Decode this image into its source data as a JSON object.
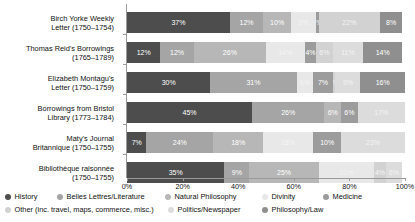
{
  "chart_data": {
    "type": "bar",
    "orientation": "horizontal",
    "stacked": true,
    "normalized": "100%",
    "title": "",
    "xlabel": "",
    "ylabel": "",
    "xlim": [
      0,
      100
    ],
    "grid": false,
    "legend_position": "bottom",
    "axis_ticks": [
      "0%",
      "20%",
      "40%",
      "60%",
      "80%",
      "100%"
    ],
    "axis_tick_values": [
      0,
      20,
      40,
      60,
      80,
      100
    ],
    "categories": [
      "Birch Yorke Weekly Letter (1750–1754)",
      "Thomas Reid's Borrowings (1765–1789)",
      "Elizabeth Montagu's Letter (1750–1759)",
      "Borrowings from Bristol Library (1773–1784)",
      "Maty's Journal Britannique (1750–1755)",
      "Bibliothèque raisonnée (1750–1755)"
    ],
    "category_lines": [
      [
        "Birch Yorke Weekly",
        "Letter (1750–1754)"
      ],
      [
        "Thomas Reid's Borrowings",
        "(1765–1789)"
      ],
      [
        "Elizabeth Montagu's",
        "Letter (1750–1759)"
      ],
      [
        "Borrowings from Bristol",
        "Library (1773–1784)"
      ],
      [
        "Maty's Journal",
        "Britannique (1750–1755)"
      ],
      [
        "Bibliothèque raisonnée",
        "(1750–1755)"
      ]
    ],
    "series": [
      {
        "name": "History",
        "color": "#4d4d4d",
        "values": [
          37,
          12,
          30,
          45,
          7,
          35
        ]
      },
      {
        "name": "Belles Lettres/Literature",
        "color": "#a5a5a5",
        "values": [
          12,
          12,
          31,
          26,
          24,
          9
        ]
      },
      {
        "name": "Natural Philosophy",
        "color": "#b7b7b7",
        "values": [
          10,
          26,
          0,
          6,
          18,
          25
        ]
      },
      {
        "name": "Divinity",
        "color": "#e8e8e8",
        "values": [
          9,
          14,
          6,
          0,
          18,
          20
        ]
      },
      {
        "name": "Medicine",
        "color": "#9c9c9c",
        "values": [
          1,
          4,
          7,
          6,
          10,
          0
        ]
      },
      {
        "name": "Other (inc. travel, maps, commerce, misc.)",
        "color": "#d2d2d2",
        "values": [
          22,
          6,
          1,
          0,
          0,
          4
        ]
      },
      {
        "name": "Politics/Newspaper",
        "color": "#dcdcdc",
        "values": [
          0,
          11,
          9,
          17,
          23,
          6
        ]
      },
      {
        "name": "Philosophy/Law",
        "color": "#8f8f8f",
        "values": [
          8,
          14,
          16,
          0,
          0,
          0
        ]
      }
    ],
    "bar_labels": [
      [
        "37%",
        "12%",
        "10%",
        "9%",
        "1%",
        "22%",
        "",
        "8%"
      ],
      [
        "12%",
        "12%",
        "26%",
        "14%",
        "4%",
        "6%",
        "11%",
        "14%"
      ],
      [
        "30%",
        "31%",
        "",
        "6%",
        "7%",
        "1%",
        "9%",
        "16%"
      ],
      [
        "45%",
        "26%",
        "6%",
        "",
        "6%",
        "",
        "17%",
        ""
      ],
      [
        "7%",
        "24%",
        "18%",
        "18%",
        "10%",
        "0",
        "23%",
        ""
      ],
      [
        "35%",
        "9%",
        "25%",
        "20%",
        "0",
        "4%",
        "6%",
        ""
      ]
    ]
  },
  "legend": {
    "items": [
      {
        "label": "History",
        "color": "#4d4d4d"
      },
      {
        "label": "Belles Lettres/Literature",
        "color": "#a5a5a5"
      },
      {
        "label": "Natural Philosophy",
        "color": "#b7b7b7"
      },
      {
        "label": "Divinity",
        "color": "#e8e8e8"
      },
      {
        "label": "Medicine",
        "color": "#9c9c9c"
      },
      {
        "label": "Other (inc. travel, maps, commerce, misc.)",
        "color": "#d2d2d2"
      },
      {
        "label": "Politics/Newspaper",
        "color": "#dcdcdc"
      },
      {
        "label": "Philosophy/Law",
        "color": "#8f8f8f"
      }
    ]
  }
}
